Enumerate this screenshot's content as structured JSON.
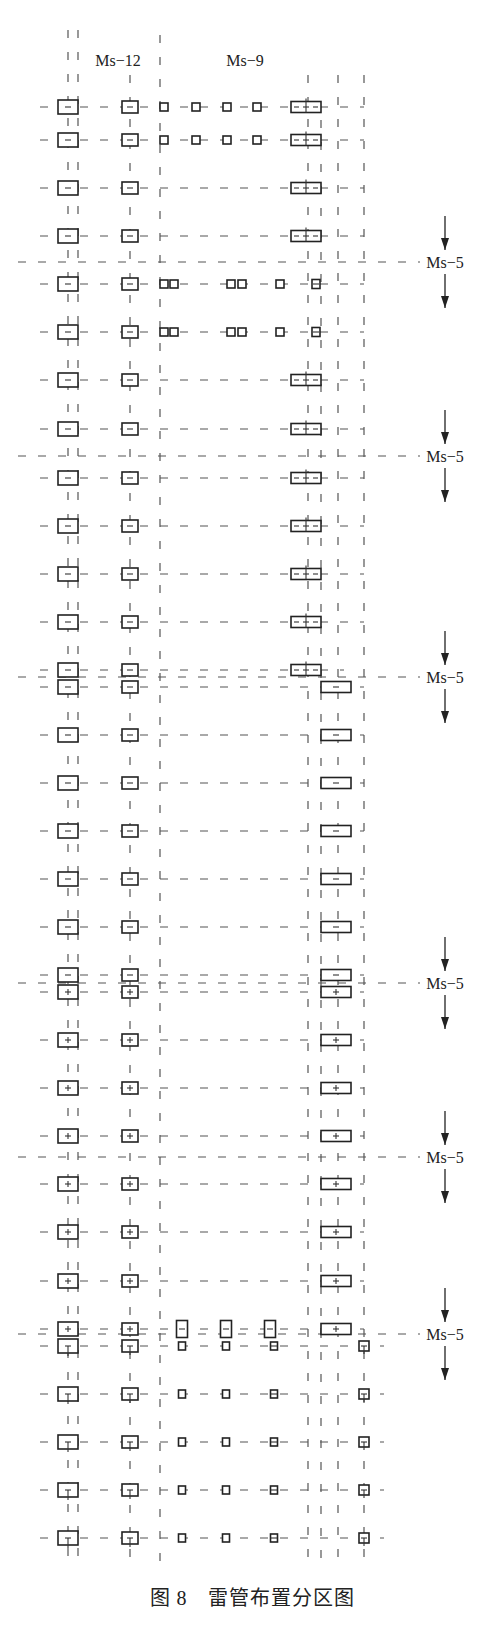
{
  "caption": {
    "figure_number": "图 8",
    "title": "雷管布置分区图"
  },
  "column_labels": [
    {
      "text": "Ms−12",
      "x": 118,
      "y": 66
    },
    {
      "text": "Ms−9",
      "x": 245,
      "y": 66
    }
  ],
  "vertical_lines": [
    {
      "x": 68,
      "y1": 30,
      "y2": 1570
    },
    {
      "x": 78,
      "y1": 30,
      "y2": 1570
    },
    {
      "x": 130,
      "y1": 75,
      "y2": 1570
    },
    {
      "x": 160,
      "y1": 35,
      "y2": 1570
    },
    {
      "x": 308,
      "y1": 75,
      "y2": 1570
    },
    {
      "x": 321,
      "y1": 120,
      "y2": 1570
    },
    {
      "x": 338,
      "y1": 75,
      "y2": 1570
    },
    {
      "x": 364,
      "y1": 75,
      "y2": 1570
    }
  ],
  "ms5_dividers": [
    {
      "y": 262,
      "label": "Ms−5"
    },
    {
      "y": 456,
      "label": "Ms−5"
    },
    {
      "y": 677,
      "label": "Ms−5"
    },
    {
      "y": 983,
      "label": "Ms−5"
    },
    {
      "y": 1157,
      "label": "Ms−5"
    },
    {
      "y": 1334,
      "label": "Ms−5"
    }
  ],
  "divider_label_x": 440,
  "rows": [
    {
      "y": 107,
      "x_end": 364,
      "items": [
        {
          "x": 68,
          "w": 20,
          "h": 14,
          "g": "minus"
        },
        {
          "x": 130,
          "w": 16,
          "h": 12,
          "g": "minus"
        },
        {
          "x": 164,
          "w": 8,
          "h": 8,
          "g": "none"
        },
        {
          "x": 196,
          "w": 8,
          "h": 8,
          "g": "none"
        },
        {
          "x": 227,
          "w": 8,
          "h": 8,
          "g": "none"
        },
        {
          "x": 257,
          "w": 8,
          "h": 8,
          "g": "none"
        },
        {
          "x": 306,
          "w": 30,
          "h": 11,
          "g": "split"
        }
      ]
    },
    {
      "y": 140,
      "x_end": 364,
      "items": [
        {
          "x": 68,
          "w": 20,
          "h": 14,
          "g": "minus"
        },
        {
          "x": 130,
          "w": 16,
          "h": 12,
          "g": "minus"
        },
        {
          "x": 164,
          "w": 8,
          "h": 8,
          "g": "none"
        },
        {
          "x": 196,
          "w": 8,
          "h": 8,
          "g": "none"
        },
        {
          "x": 227,
          "w": 8,
          "h": 8,
          "g": "none"
        },
        {
          "x": 257,
          "w": 8,
          "h": 8,
          "g": "none"
        },
        {
          "x": 306,
          "w": 30,
          "h": 11,
          "g": "split"
        }
      ]
    },
    {
      "y": 188,
      "x_end": 364,
      "items": [
        {
          "x": 68,
          "w": 20,
          "h": 14,
          "g": "minus"
        },
        {
          "x": 130,
          "w": 16,
          "h": 12,
          "g": "minus"
        },
        {
          "x": 306,
          "w": 30,
          "h": 11,
          "g": "split"
        }
      ]
    },
    {
      "y": 236,
      "x_end": 364,
      "items": [
        {
          "x": 68,
          "w": 20,
          "h": 14,
          "g": "minus"
        },
        {
          "x": 130,
          "w": 16,
          "h": 12,
          "g": "minus"
        },
        {
          "x": 306,
          "w": 30,
          "h": 11,
          "g": "split"
        }
      ]
    },
    {
      "y": 284,
      "x_end": 364,
      "items": [
        {
          "x": 68,
          "w": 20,
          "h": 14,
          "g": "minus"
        },
        {
          "x": 130,
          "w": 16,
          "h": 12,
          "g": "minus"
        },
        {
          "x": 164,
          "w": 8,
          "h": 8,
          "g": "none"
        },
        {
          "x": 174,
          "w": 8,
          "h": 8,
          "g": "none"
        },
        {
          "x": 231,
          "w": 8,
          "h": 8,
          "g": "none"
        },
        {
          "x": 242,
          "w": 8,
          "h": 8,
          "g": "none"
        },
        {
          "x": 280,
          "w": 8,
          "h": 8,
          "g": "none"
        },
        {
          "x": 316,
          "w": 8,
          "h": 9,
          "g": "minus"
        }
      ]
    },
    {
      "y": 332,
      "x_end": 364,
      "items": [
        {
          "x": 68,
          "w": 20,
          "h": 14,
          "g": "minus"
        },
        {
          "x": 130,
          "w": 16,
          "h": 12,
          "g": "minus"
        },
        {
          "x": 164,
          "w": 8,
          "h": 8,
          "g": "none"
        },
        {
          "x": 174,
          "w": 8,
          "h": 8,
          "g": "none"
        },
        {
          "x": 231,
          "w": 8,
          "h": 8,
          "g": "none"
        },
        {
          "x": 242,
          "w": 8,
          "h": 8,
          "g": "none"
        },
        {
          "x": 280,
          "w": 8,
          "h": 8,
          "g": "none"
        },
        {
          "x": 316,
          "w": 8,
          "h": 9,
          "g": "minus"
        }
      ]
    },
    {
      "y": 380,
      "x_end": 364,
      "items": [
        {
          "x": 68,
          "w": 20,
          "h": 14,
          "g": "minus"
        },
        {
          "x": 130,
          "w": 16,
          "h": 12,
          "g": "minus"
        },
        {
          "x": 306,
          "w": 30,
          "h": 11,
          "g": "split"
        }
      ]
    },
    {
      "y": 429,
      "x_end": 364,
      "items": [
        {
          "x": 68,
          "w": 20,
          "h": 14,
          "g": "minus"
        },
        {
          "x": 130,
          "w": 16,
          "h": 12,
          "g": "minus"
        },
        {
          "x": 306,
          "w": 30,
          "h": 11,
          "g": "split"
        }
      ]
    },
    {
      "y": 478,
      "x_end": 364,
      "items": [
        {
          "x": 68,
          "w": 20,
          "h": 14,
          "g": "minus"
        },
        {
          "x": 130,
          "w": 16,
          "h": 12,
          "g": "minus"
        },
        {
          "x": 306,
          "w": 30,
          "h": 11,
          "g": "split"
        }
      ]
    },
    {
      "y": 526,
      "x_end": 364,
      "items": [
        {
          "x": 68,
          "w": 20,
          "h": 14,
          "g": "minus"
        },
        {
          "x": 130,
          "w": 16,
          "h": 12,
          "g": "minus"
        },
        {
          "x": 306,
          "w": 30,
          "h": 11,
          "g": "split"
        }
      ]
    },
    {
      "y": 574,
      "x_end": 364,
      "items": [
        {
          "x": 68,
          "w": 20,
          "h": 14,
          "g": "minus"
        },
        {
          "x": 130,
          "w": 16,
          "h": 12,
          "g": "minus"
        },
        {
          "x": 306,
          "w": 30,
          "h": 11,
          "g": "split"
        }
      ]
    },
    {
      "y": 622,
      "x_end": 364,
      "items": [
        {
          "x": 68,
          "w": 20,
          "h": 14,
          "g": "minus"
        },
        {
          "x": 130,
          "w": 16,
          "h": 12,
          "g": "minus"
        },
        {
          "x": 306,
          "w": 30,
          "h": 11,
          "g": "split"
        }
      ]
    },
    {
      "y": 670,
      "x_end": 344,
      "items": [
        {
          "x": 68,
          "w": 20,
          "h": 14,
          "g": "minus"
        },
        {
          "x": 130,
          "w": 16,
          "h": 12,
          "g": "minus"
        },
        {
          "x": 306,
          "w": 30,
          "h": 11,
          "g": "split"
        }
      ]
    },
    {
      "y": 687,
      "x_end": 364,
      "items": [
        {
          "x": 68,
          "w": 20,
          "h": 14,
          "g": "minus"
        },
        {
          "x": 130,
          "w": 16,
          "h": 12,
          "g": "minus"
        },
        {
          "x": 336,
          "w": 30,
          "h": 11,
          "g": "minus"
        }
      ]
    },
    {
      "y": 735,
      "x_end": 364,
      "items": [
        {
          "x": 68,
          "w": 20,
          "h": 14,
          "g": "minus"
        },
        {
          "x": 130,
          "w": 16,
          "h": 12,
          "g": "minus"
        },
        {
          "x": 336,
          "w": 30,
          "h": 11,
          "g": "minus"
        }
      ]
    },
    {
      "y": 783,
      "x_end": 364,
      "items": [
        {
          "x": 68,
          "w": 20,
          "h": 14,
          "g": "minus"
        },
        {
          "x": 130,
          "w": 16,
          "h": 12,
          "g": "minus"
        },
        {
          "x": 336,
          "w": 30,
          "h": 11,
          "g": "minus"
        }
      ]
    },
    {
      "y": 831,
      "x_end": 364,
      "items": [
        {
          "x": 68,
          "w": 20,
          "h": 14,
          "g": "minus"
        },
        {
          "x": 130,
          "w": 16,
          "h": 12,
          "g": "minus"
        },
        {
          "x": 336,
          "w": 30,
          "h": 11,
          "g": "minus"
        }
      ]
    },
    {
      "y": 879,
      "x_end": 364,
      "items": [
        {
          "x": 68,
          "w": 20,
          "h": 14,
          "g": "minus"
        },
        {
          "x": 130,
          "w": 16,
          "h": 12,
          "g": "minus"
        },
        {
          "x": 336,
          "w": 30,
          "h": 11,
          "g": "minus"
        }
      ]
    },
    {
      "y": 927,
      "x_end": 364,
      "items": [
        {
          "x": 68,
          "w": 20,
          "h": 14,
          "g": "minus"
        },
        {
          "x": 130,
          "w": 16,
          "h": 12,
          "g": "minus"
        },
        {
          "x": 336,
          "w": 30,
          "h": 11,
          "g": "minus"
        }
      ]
    },
    {
      "y": 975,
      "x_end": 364,
      "items": [
        {
          "x": 68,
          "w": 20,
          "h": 14,
          "g": "minus"
        },
        {
          "x": 130,
          "w": 16,
          "h": 12,
          "g": "minus"
        },
        {
          "x": 336,
          "w": 30,
          "h": 11,
          "g": "minus"
        }
      ]
    },
    {
      "y": 992,
      "x_end": 364,
      "items": [
        {
          "x": 68,
          "w": 20,
          "h": 14,
          "g": "plus"
        },
        {
          "x": 130,
          "w": 16,
          "h": 12,
          "g": "plus"
        },
        {
          "x": 336,
          "w": 30,
          "h": 11,
          "g": "plus"
        }
      ]
    },
    {
      "y": 1040,
      "x_end": 364,
      "items": [
        {
          "x": 68,
          "w": 20,
          "h": 14,
          "g": "plus"
        },
        {
          "x": 130,
          "w": 16,
          "h": 12,
          "g": "plus"
        },
        {
          "x": 336,
          "w": 30,
          "h": 11,
          "g": "plus"
        }
      ]
    },
    {
      "y": 1088,
      "x_end": 364,
      "items": [
        {
          "x": 68,
          "w": 20,
          "h": 14,
          "g": "plus"
        },
        {
          "x": 130,
          "w": 16,
          "h": 12,
          "g": "plus"
        },
        {
          "x": 336,
          "w": 30,
          "h": 11,
          "g": "plus"
        }
      ]
    },
    {
      "y": 1136,
      "x_end": 364,
      "items": [
        {
          "x": 68,
          "w": 20,
          "h": 14,
          "g": "plus"
        },
        {
          "x": 130,
          "w": 16,
          "h": 12,
          "g": "plus"
        },
        {
          "x": 336,
          "w": 30,
          "h": 11,
          "g": "plus"
        }
      ]
    },
    {
      "y": 1184,
      "x_end": 364,
      "items": [
        {
          "x": 68,
          "w": 20,
          "h": 14,
          "g": "plus"
        },
        {
          "x": 130,
          "w": 16,
          "h": 12,
          "g": "plus"
        },
        {
          "x": 336,
          "w": 30,
          "h": 11,
          "g": "plus"
        }
      ]
    },
    {
      "y": 1232,
      "x_end": 364,
      "items": [
        {
          "x": 68,
          "w": 20,
          "h": 14,
          "g": "plus"
        },
        {
          "x": 130,
          "w": 16,
          "h": 12,
          "g": "plus"
        },
        {
          "x": 336,
          "w": 30,
          "h": 11,
          "g": "plus"
        }
      ]
    },
    {
      "y": 1281,
      "x_end": 364,
      "items": [
        {
          "x": 68,
          "w": 20,
          "h": 14,
          "g": "plus"
        },
        {
          "x": 130,
          "w": 16,
          "h": 12,
          "g": "plus"
        },
        {
          "x": 336,
          "w": 30,
          "h": 11,
          "g": "plus"
        }
      ]
    },
    {
      "y": 1329,
      "x_end": 364,
      "items": [
        {
          "x": 68,
          "w": 20,
          "h": 14,
          "g": "plus"
        },
        {
          "x": 130,
          "w": 16,
          "h": 12,
          "g": "plus"
        },
        {
          "x": 182,
          "w": 11,
          "h": 17,
          "g": "minus"
        },
        {
          "x": 226,
          "w": 11,
          "h": 17,
          "g": "minus"
        },
        {
          "x": 270,
          "w": 11,
          "h": 17,
          "g": "minus"
        },
        {
          "x": 336,
          "w": 30,
          "h": 11,
          "g": "plus"
        }
      ]
    },
    {
      "y": 1346,
      "x_end": 384,
      "items": [
        {
          "x": 68,
          "w": 20,
          "h": 14,
          "g": "tee"
        },
        {
          "x": 130,
          "w": 16,
          "h": 12,
          "g": "tee"
        },
        {
          "x": 182,
          "w": 7,
          "h": 8,
          "g": "none"
        },
        {
          "x": 226,
          "w": 7,
          "h": 8,
          "g": "none"
        },
        {
          "x": 274,
          "w": 7,
          "h": 8,
          "g": "minus"
        },
        {
          "x": 364,
          "w": 10,
          "h": 10,
          "g": "tee"
        }
      ]
    },
    {
      "y": 1394,
      "x_end": 384,
      "items": [
        {
          "x": 68,
          "w": 20,
          "h": 14,
          "g": "tee"
        },
        {
          "x": 130,
          "w": 16,
          "h": 12,
          "g": "tee"
        },
        {
          "x": 182,
          "w": 7,
          "h": 8,
          "g": "none"
        },
        {
          "x": 226,
          "w": 7,
          "h": 8,
          "g": "none"
        },
        {
          "x": 274,
          "w": 7,
          "h": 8,
          "g": "minus"
        },
        {
          "x": 364,
          "w": 10,
          "h": 10,
          "g": "tee"
        }
      ]
    },
    {
      "y": 1442,
      "x_end": 384,
      "items": [
        {
          "x": 68,
          "w": 20,
          "h": 14,
          "g": "tee"
        },
        {
          "x": 130,
          "w": 16,
          "h": 12,
          "g": "tee"
        },
        {
          "x": 182,
          "w": 7,
          "h": 8,
          "g": "none"
        },
        {
          "x": 226,
          "w": 7,
          "h": 8,
          "g": "none"
        },
        {
          "x": 274,
          "w": 7,
          "h": 8,
          "g": "minus"
        },
        {
          "x": 364,
          "w": 10,
          "h": 10,
          "g": "tee"
        }
      ]
    },
    {
      "y": 1490,
      "x_end": 384,
      "items": [
        {
          "x": 68,
          "w": 20,
          "h": 14,
          "g": "tee"
        },
        {
          "x": 130,
          "w": 16,
          "h": 12,
          "g": "tee"
        },
        {
          "x": 182,
          "w": 7,
          "h": 8,
          "g": "none"
        },
        {
          "x": 226,
          "w": 7,
          "h": 8,
          "g": "none"
        },
        {
          "x": 274,
          "w": 7,
          "h": 8,
          "g": "minus"
        },
        {
          "x": 364,
          "w": 10,
          "h": 10,
          "g": "tee"
        }
      ]
    },
    {
      "y": 1538,
      "x_end": 384,
      "items": [
        {
          "x": 68,
          "w": 20,
          "h": 14,
          "g": "tee"
        },
        {
          "x": 130,
          "w": 16,
          "h": 12,
          "g": "tee"
        },
        {
          "x": 182,
          "w": 7,
          "h": 8,
          "g": "none"
        },
        {
          "x": 226,
          "w": 7,
          "h": 8,
          "g": "none"
        },
        {
          "x": 274,
          "w": 7,
          "h": 8,
          "g": "minus"
        },
        {
          "x": 364,
          "w": 10,
          "h": 10,
          "g": "tee"
        }
      ]
    }
  ]
}
